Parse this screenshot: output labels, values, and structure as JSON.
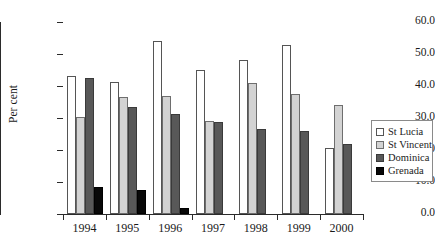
{
  "chart_data": {
    "type": "bar",
    "title": "",
    "subtitle": "",
    "xlabel": "",
    "ylabel": "Per cent",
    "ylim": [
      0,
      60
    ],
    "ytick_labels": [
      "0.0",
      "10.0",
      "20.0",
      "30.0",
      "40.0",
      "50.0",
      "60.0"
    ],
    "ytick_values": [
      0,
      10,
      20,
      30,
      40,
      50,
      60
    ],
    "grid": false,
    "legend_position": "right",
    "categories": [
      "1994",
      "1995",
      "1996",
      "1997",
      "1998",
      "1999",
      "2000"
    ],
    "series": [
      {
        "name": "St Lucia",
        "color": "#ffffff",
        "values": [
          43.0,
          41.3,
          54.0,
          45.0,
          48.0,
          52.8,
          20.5
        ]
      },
      {
        "name": "St Vincent",
        "color": "#d3d3d3",
        "values": [
          30.3,
          36.5,
          36.8,
          29.0,
          41.0,
          37.5,
          34.0
        ]
      },
      {
        "name": "Dominica",
        "color": "#585858",
        "values": [
          42.5,
          33.5,
          31.3,
          28.8,
          26.5,
          26.0,
          22.0
        ]
      },
      {
        "name": "Grenada",
        "color": "#080808",
        "values": [
          8.5,
          7.5,
          2.0,
          0.0,
          0.0,
          0.0,
          0.0
        ]
      }
    ]
  }
}
